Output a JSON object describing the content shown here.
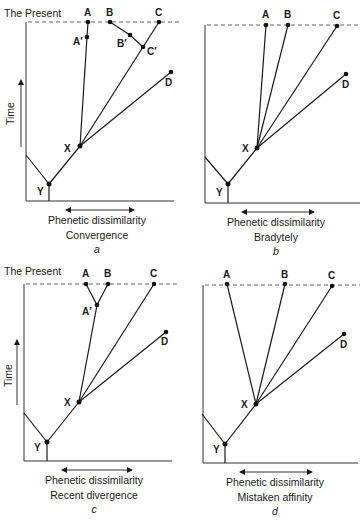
{
  "figure": {
    "present_label": "The Present",
    "time_label": "Time",
    "xaxis_label": "Phenetic dissimilarity",
    "panels": [
      {
        "id": "a",
        "caption": "Convergence",
        "letter": "a",
        "nodes": {
          "A": [
            88,
            22
          ],
          "A'": [
            87,
            37
          ],
          "B": [
            110,
            22
          ],
          "B'": [
            130,
            35
          ],
          "C'": [
            143,
            47
          ],
          "C": [
            159,
            22
          ],
          "D": [
            171,
            72
          ],
          "X": [
            80,
            146
          ],
          "Y": [
            49,
            184
          ]
        },
        "edges": [
          [
            "X",
            "A'"
          ],
          [
            "A'",
            "A"
          ],
          [
            "X",
            "C'"
          ],
          [
            "C'",
            "C"
          ],
          [
            "C'",
            "B'"
          ],
          [
            "B'",
            "B"
          ],
          [
            "X",
            "D"
          ],
          [
            "Y",
            "X"
          ]
        ]
      },
      {
        "id": "b",
        "caption": "Bradytely",
        "letter": "b",
        "nodes": {
          "A": [
            266,
            25
          ],
          "B": [
            288,
            25
          ],
          "C": [
            337,
            26
          ],
          "D": [
            346,
            74
          ],
          "X": [
            257,
            148
          ],
          "Y": [
            228,
            184
          ]
        },
        "edges": [
          [
            "X",
            "A"
          ],
          [
            "X",
            "B"
          ],
          [
            "X",
            "C"
          ],
          [
            "X",
            "D"
          ],
          [
            "Y",
            "X"
          ]
        ]
      },
      {
        "id": "c",
        "caption": "Recent divergence",
        "letter": "c",
        "nodes": {
          "A": [
            86,
            284
          ],
          "B": [
            108,
            284
          ],
          "A'": [
            97,
            305
          ],
          "C": [
            154,
            284
          ],
          "D": [
            166,
            332
          ],
          "X": [
            79,
            402
          ],
          "Y": [
            47,
            442
          ]
        },
        "edges": [
          [
            "X",
            "A'"
          ],
          [
            "A'",
            "A"
          ],
          [
            "A'",
            "B"
          ],
          [
            "X",
            "C"
          ],
          [
            "X",
            "D"
          ],
          [
            "Y",
            "X"
          ]
        ]
      },
      {
        "id": "d",
        "caption": "Mistaken affinity",
        "letter": "d",
        "nodes": {
          "A": [
            227,
            284
          ],
          "B": [
            285,
            284
          ],
          "C": [
            332,
            286
          ],
          "D": [
            344,
            334
          ],
          "X": [
            256,
            404
          ],
          "Y": [
            225,
            444
          ]
        },
        "edges": [
          [
            "X",
            "A"
          ],
          [
            "X",
            "B"
          ],
          [
            "X",
            "C"
          ],
          [
            "X",
            "D"
          ],
          [
            "Y",
            "X"
          ]
        ]
      }
    ]
  }
}
